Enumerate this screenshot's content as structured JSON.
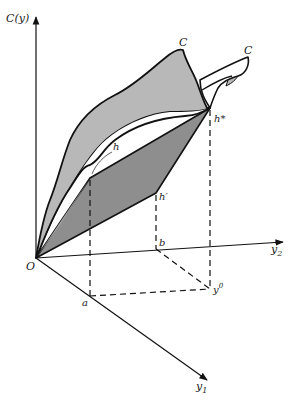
{
  "diagram": {
    "type": "3d-cost-function-surface",
    "axes": {
      "vertical": {
        "label": "C(y)"
      },
      "horizontal_right": {
        "label": "y",
        "subscript": "2"
      },
      "diagonal_down": {
        "label": "y",
        "subscript": "1"
      },
      "origin": {
        "label": "O"
      }
    },
    "points": {
      "a": {
        "label": "a"
      },
      "b": {
        "label": "b"
      },
      "y0": {
        "label": "y",
        "superscript": "0"
      },
      "h": {
        "label": "h"
      },
      "h_prime": {
        "label": "h′"
      },
      "h_star": {
        "label": "h*"
      }
    },
    "curves": [
      {
        "label": "C"
      },
      {
        "label": "C"
      }
    ],
    "colors": {
      "outer_surface": "#b8b8b8",
      "plane": "#8e8e8e",
      "line": "#111111",
      "background": "#ffffff"
    }
  }
}
